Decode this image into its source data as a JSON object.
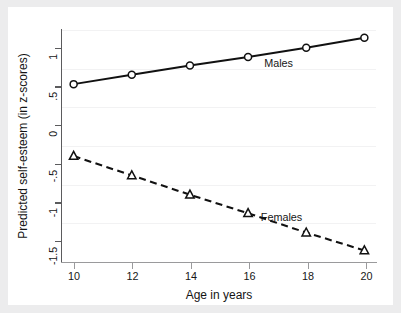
{
  "chart_data": {
    "type": "line",
    "title": "",
    "xlabel": "Age in years",
    "ylabel": "Predicted self-esteem (in z-scores)",
    "x": [
      10,
      12,
      14,
      16,
      18,
      20
    ],
    "xlim": [
      9.6,
      20.4
    ],
    "ylim": [
      -1.78,
      1.22
    ],
    "xticks": [
      "10",
      "12",
      "14",
      "16",
      "18",
      "20"
    ],
    "yticks": [
      "1",
      ".5",
      "0",
      "-.5",
      "-1",
      "-1.5"
    ],
    "ytick_values": [
      1,
      0.5,
      0,
      -0.5,
      -1,
      -1.5
    ],
    "grid": "horizontal",
    "legend": "inline-annotations",
    "series": [
      {
        "name": "Males",
        "values": [
          0.52,
          0.64,
          0.76,
          0.87,
          0.99,
          1.12
        ],
        "marker": "circle-open",
        "line_style": "solid",
        "color": "#111111",
        "annotation": {
          "text": "Males",
          "x": 17.05,
          "y": 0.8
        }
      },
      {
        "name": "Females",
        "values": [
          -0.41,
          -0.66,
          -0.91,
          -1.15,
          -1.4,
          -1.63
        ],
        "marker": "triangle-open",
        "line_style": "dashed",
        "color": "#111111",
        "annotation": {
          "text": "Females",
          "x": 17.15,
          "y": -1.2
        }
      }
    ]
  },
  "figure": {
    "background_color": "#ececed",
    "canvas_color": "#ffffff",
    "axis_color": "#5b5b5d",
    "gridline_color": "#f2f2f3"
  }
}
